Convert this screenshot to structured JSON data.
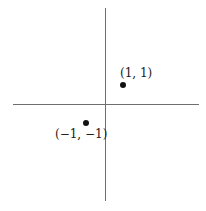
{
  "diagram": {
    "type": "cartesian-plane",
    "axes": {
      "x_axis": "horizontal",
      "y_axis": "vertical",
      "color": "#6e6e6e"
    },
    "points": [
      {
        "label": "(1, 1)",
        "x": 1,
        "y": 1
      },
      {
        "label": "(−1, −1)",
        "x": -1,
        "y": -1
      }
    ]
  }
}
